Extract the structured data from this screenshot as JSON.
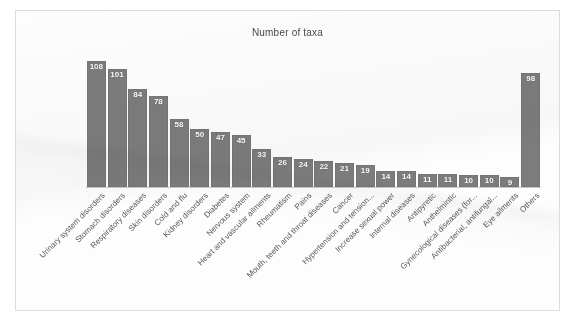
{
  "chart_data": {
    "type": "bar",
    "title": "Number of taxa",
    "xlabel": "",
    "ylabel": "",
    "ylim": [
      0,
      108
    ],
    "grid": false,
    "legend": null,
    "orientation": "vertical",
    "bar_color": "#7c7c7c",
    "value_label_color": "#ffffff",
    "categories": [
      "Urinary system disorders",
      "Stomach disorders",
      "Respiratory diseases",
      "Skin disorders",
      "Cold and flu",
      "Kidney disorders",
      "Diabetes",
      "Nervous system",
      "Heart and vascular ailments",
      "Rheumatism",
      "Pains",
      "Mouth, teeth and throat diseases",
      "Cancer",
      "Hypertension and tension...",
      "Increase sexual power",
      "Internal diseases",
      "Antipyretic",
      "Anthelmintic",
      "Gynecological diseases (for...",
      "Antibacterial, antifungal...",
      "Eye ailments",
      "Others"
    ],
    "values": [
      108,
      101,
      84,
      78,
      58,
      50,
      47,
      45,
      33,
      26,
      24,
      22,
      21,
      19,
      14,
      14,
      11,
      11,
      10,
      10,
      9,
      98
    ]
  },
  "figure": {
    "border_color": "#dcdcdc",
    "background": "#fdfdfd"
  }
}
